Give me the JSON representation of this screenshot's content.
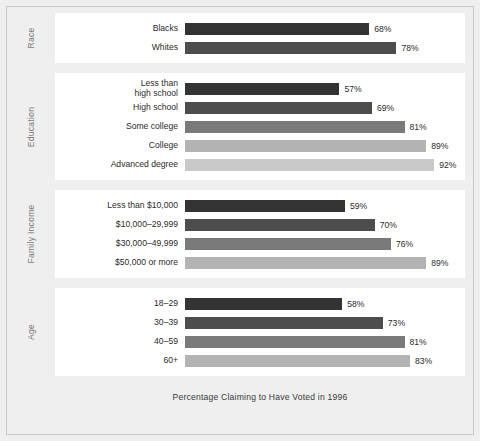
{
  "chart_data": {
    "type": "bar",
    "title": "",
    "caption": "Percentage Claiming to Have Voted in 1996",
    "xlabel": "Percentage Claiming to Have Voted in 1996",
    "ylabel": "",
    "orientation": "horizontal",
    "xlim": [
      0,
      100
    ],
    "units": "%",
    "grid": false,
    "legend": "none",
    "groups": [
      {
        "name": "Race",
        "categories": [
          "Blacks",
          "Whites"
        ],
        "values": [
          68,
          78
        ],
        "value_labels": [
          "68%",
          "78%"
        ],
        "colors": [
          "#333333",
          "#4d4d4d"
        ]
      },
      {
        "name": "Education",
        "categories": [
          "Less than\nhigh school",
          "High school",
          "Some college",
          "College",
          "Advanced degree"
        ],
        "values": [
          57,
          69,
          81,
          89,
          92
        ],
        "value_labels": [
          "57%",
          "69%",
          "81%",
          "89%",
          "92%"
        ],
        "colors": [
          "#333333",
          "#4d4d4d",
          "#7a7a7a",
          "#b3b3b3",
          "#c9c9c9"
        ]
      },
      {
        "name": "Family Income",
        "categories": [
          "Less than $10,000",
          "$10,000–29,999",
          "$30,000–49,999",
          "$50,000 or more"
        ],
        "values": [
          59,
          70,
          76,
          89
        ],
        "value_labels": [
          "59%",
          "70%",
          "76%",
          "89%"
        ],
        "colors": [
          "#333333",
          "#4d4d4d",
          "#7a7a7a",
          "#b3b3b3"
        ]
      },
      {
        "name": "Age",
        "categories": [
          "18–29",
          "30–39",
          "40–59",
          "60+"
        ],
        "values": [
          58,
          73,
          81,
          83
        ],
        "value_labels": [
          "58%",
          "73%",
          "81%",
          "83%"
        ],
        "colors": [
          "#333333",
          "#4d4d4d",
          "#7a7a7a",
          "#b3b3b3"
        ]
      }
    ]
  },
  "figure": {
    "background": "#efefef",
    "panel_background": "#ffffff",
    "border_color": "#c9c9c9",
    "text_color": "#2b2b2b",
    "group_label_color": "#7b7b7b"
  }
}
